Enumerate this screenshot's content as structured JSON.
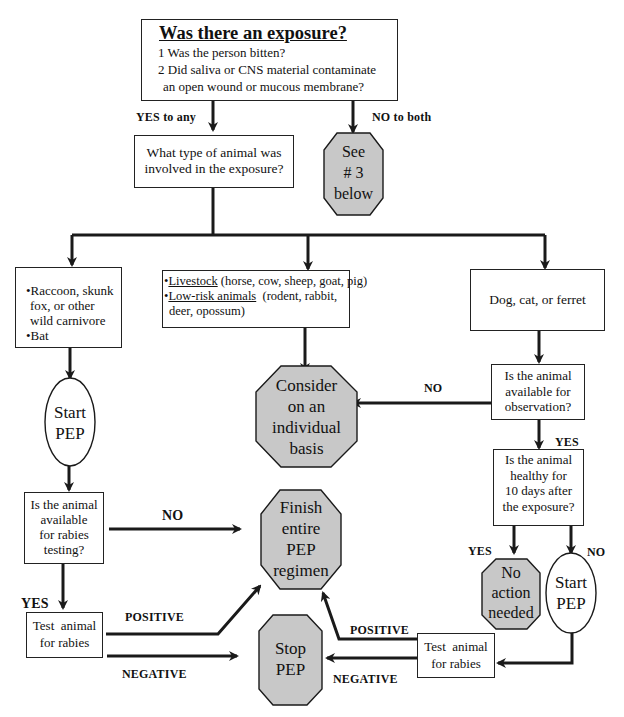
{
  "diagram": {
    "type": "flowchart",
    "colors": {
      "terminal_fill": "#c8c8c8",
      "stroke": "#1a1a1a",
      "box_fill": "#ffffff"
    },
    "exposure": {
      "title": "Was there an exposure?",
      "q1": "1  Was the person bitten?",
      "q2_line1": "2  Did saliva or CNS material contaminate",
      "q2_line2": "an open wound or mucous membrane?"
    },
    "labels": {
      "yes_to_any": "YES to any",
      "no_to_both": "NO to both",
      "no_observation": "NO",
      "yes_observation": "YES",
      "no_testing": "NO",
      "yes_testing": "YES",
      "yes_healthy": "YES",
      "no_healthy": "NO",
      "positive_left": "POSITIVE",
      "negative_left": "NEGATIVE",
      "positive_right": "POSITIVE",
      "negative_right": "NEGATIVE"
    },
    "see3": {
      "line1": "See",
      "line2": "# 3",
      "line3": "below"
    },
    "animal_type": {
      "line1": "What type of animal was",
      "line2": "involved in the exposure?"
    },
    "wild": {
      "line1": "•Raccoon, skunk",
      "line2": "fox, or other",
      "line3": "wild carnivore",
      "line4": "•Bat"
    },
    "livestock": {
      "bullet": "•",
      "livestock_u": "Livestock",
      "livestock_rest": " (horse, cow, sheep, goat, pig)",
      "lowrisk_u": "Low-risk animals",
      "lowrisk_rest": "  (rodent, rabbit,",
      "line3": "deer, opossum)"
    },
    "pets": {
      "label": "Dog, cat, or ferret"
    },
    "start_pep_left": {
      "line1": "Start",
      "line2": "PEP"
    },
    "consider": {
      "line1": "Consider",
      "line2": "on an",
      "line3": "individual",
      "line4": "basis"
    },
    "available_observation": {
      "line1": "Is the animal",
      "line2": "available for",
      "line3": "observation?"
    },
    "healthy": {
      "line1": "Is the animal",
      "line2": "healthy for",
      "line3": "10 days after",
      "line4": "the exposure?"
    },
    "available_testing": {
      "line1": "Is the animal",
      "line2": "available",
      "line3": "for rabies",
      "line4": "testing?"
    },
    "finish": {
      "line1": "Finish",
      "line2": "entire",
      "line3": "PEP",
      "line4": "regimen"
    },
    "no_action": {
      "line1": "No",
      "line2": "action",
      "line3": "needed"
    },
    "start_pep_right": {
      "line1": "Start",
      "line2": "PEP"
    },
    "test_left": {
      "line1": "Test  animal",
      "line2": "for rabies"
    },
    "test_right": {
      "line1": "Test  animal",
      "line2": "for rabies"
    },
    "stop": {
      "line1": "Stop",
      "line2": "PEP"
    }
  }
}
